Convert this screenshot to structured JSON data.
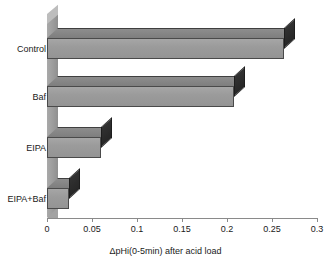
{
  "chart_data": {
    "type": "bar",
    "orientation": "horizontal",
    "style": "3d",
    "title": "",
    "categories": [
      "Control",
      "Baf",
      "EIPA",
      "EIPA+Baf"
    ],
    "values": [
      0.263,
      0.208,
      0.06,
      0.024
    ],
    "xlabel": "ΔpHi(0-5min) after acid load",
    "ylabel": "",
    "xlim": [
      0,
      0.3
    ],
    "xticks": [
      "0",
      "0.05",
      "0.1",
      "0.15",
      "0.2",
      "0.25",
      "0.3"
    ],
    "xtick_values": [
      0,
      0.05,
      0.1,
      0.15,
      0.2,
      0.25,
      0.3
    ],
    "grid": false,
    "legend": false,
    "series": [
      {
        "name": "ΔpHi(0-5min) after acid load",
        "values": [
          0.263,
          0.208,
          0.06,
          0.024
        ]
      }
    ]
  },
  "colors": {
    "bar_front": "#9b9b9b",
    "bar_top": "#858585",
    "bar_side": "#2a2a2a",
    "wall": "#9c9c9c",
    "axis": "#8a8a8a",
    "text": "#1a1a1a",
    "background": "#ffffff"
  }
}
